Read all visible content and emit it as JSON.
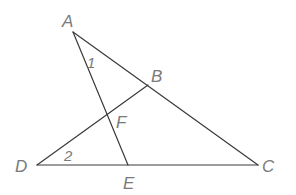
{
  "diagram": {
    "type": "geometry",
    "points": {
      "A": {
        "label": "A",
        "x": 73,
        "y": 32
      },
      "B": {
        "label": "B",
        "x": 148,
        "y": 85
      },
      "C": {
        "label": "C",
        "x": 258,
        "y": 165
      },
      "D": {
        "label": "D",
        "x": 37,
        "y": 165
      },
      "E": {
        "label": "E",
        "x": 128,
        "y": 165
      },
      "F": {
        "label": "F",
        "x": 113,
        "y": 113
      }
    },
    "segments": [
      {
        "from": "A",
        "to": "C"
      },
      {
        "from": "A",
        "to": "E"
      },
      {
        "from": "D",
        "to": "B"
      },
      {
        "from": "D",
        "to": "C"
      }
    ],
    "angle_labels": [
      {
        "label": "1",
        "vertex": "A"
      },
      {
        "label": "2",
        "vertex": "D"
      }
    ],
    "colors": {
      "line": "#3a3a3a",
      "label": "#7a7a7a",
      "background": "#ffffff"
    }
  }
}
